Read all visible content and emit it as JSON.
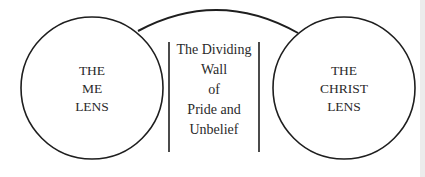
{
  "diagram": {
    "left_lens": {
      "lines": [
        "THE",
        "ME",
        "LENS"
      ]
    },
    "right_lens": {
      "lines": [
        "THE",
        "CHRIST",
        "LENS"
      ]
    },
    "wall": {
      "lines": [
        "The Dividing",
        "Wall",
        "of",
        "Pride and",
        "Unbelief"
      ]
    },
    "colors": {
      "stroke": "#1e1e1e",
      "text": "#2a2a2a",
      "background": "#ffffff"
    }
  }
}
